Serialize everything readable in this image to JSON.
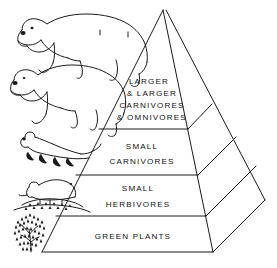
{
  "figure": {
    "type": "ecological-pyramid",
    "background_color": "#ffffff",
    "line_color": "#1a1a1a",
    "text_color": "#111111",
    "orientation": "3d-pyramid-right-face-visible"
  },
  "tiers": [
    {
      "index": 0,
      "position": "apex",
      "trophic_level": 4,
      "lines": [
        "LARGER",
        "& LARGER",
        "CARNIVORES",
        "& OMNIVORES"
      ],
      "line1": "LARGER",
      "line2": "& LARGER",
      "line3": "CARNIVORES",
      "line4": "& OMNIVORES"
    },
    {
      "index": 1,
      "position": "upper-middle",
      "trophic_level": 3,
      "lines": [
        "SMALL",
        "CARNIVORES"
      ],
      "line1": "SMALL",
      "line2": "CARNIVORES"
    },
    {
      "index": 2,
      "position": "lower-middle",
      "trophic_level": 2,
      "lines": [
        "SMALL",
        "HERBIVORES"
      ],
      "line1": "SMALL",
      "line2": "HERBIVORES"
    },
    {
      "index": 3,
      "position": "base",
      "trophic_level": 1,
      "lines": [
        "GREEN PLANTS"
      ],
      "line1": "GREEN PLANTS"
    }
  ],
  "illustrations": [
    {
      "name": "polar-bear-upper",
      "label": "large bear",
      "tier_index": 0
    },
    {
      "name": "polar-bear-lower",
      "label": "large bear",
      "tier_index": 0
    },
    {
      "name": "weasel",
      "label": "weasel",
      "tier_index": 1
    },
    {
      "name": "lemming",
      "label": "lemming on mound",
      "tier_index": 2
    },
    {
      "name": "shrub",
      "label": "shrub",
      "tier_index": 3
    }
  ]
}
